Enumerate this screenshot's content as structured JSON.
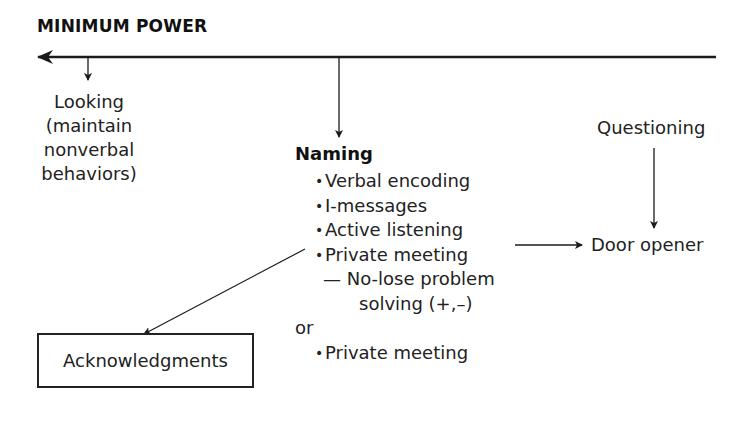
{
  "diagram": {
    "title": "MINIMUM POWER",
    "axis": {
      "direction": "left",
      "meaning": "toward minimum power"
    },
    "nodes": {
      "looking": {
        "lines": [
          "Looking",
          "(maintain",
          "nonverbal",
          "behaviors)"
        ]
      },
      "naming": {
        "heading": "Naming",
        "items": [
          {
            "bullet": "•",
            "label": "Verbal encoding"
          },
          {
            "bullet": "•",
            "label": "I-messages"
          },
          {
            "bullet": "•",
            "label": "Active listening"
          },
          {
            "bullet": "•",
            "label": "Private meeting"
          }
        ],
        "subitem_line1": "— No-lose problem",
        "subitem_line2": "solving (+,–)",
        "or_label": "or",
        "final_item": {
          "bullet": "•",
          "label": "Private meeting"
        }
      },
      "questioning": {
        "label": "Questioning"
      },
      "door_opener": {
        "label": "Door opener"
      },
      "acknowledgments": {
        "label": "Acknowledgments"
      }
    },
    "edges": [
      {
        "from": "axis",
        "to": "looking"
      },
      {
        "from": "axis",
        "to": "naming"
      },
      {
        "from": "questioning",
        "to": "door_opener"
      },
      {
        "from": "active_listening",
        "to": "door_opener"
      },
      {
        "from": "naming",
        "to": "acknowledgments"
      }
    ],
    "colors": {
      "ink": "#1a1a1a",
      "background": "#ffffff"
    }
  }
}
